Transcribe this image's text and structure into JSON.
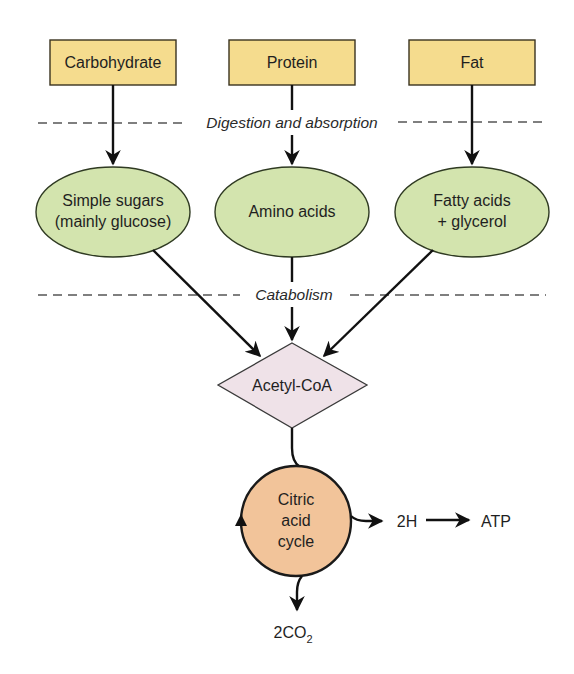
{
  "diagram": {
    "colors": {
      "nutrient_box": "#f5dc8e",
      "product_ellipse": "#d3e4ae",
      "acetyl_diamond": "#efe2e8",
      "cycle_circle": "#f2c49a",
      "arrow": "#111111",
      "dashed_separator": "#555555"
    },
    "nutrients": [
      {
        "label": "Carbohydrate"
      },
      {
        "label": "Protein"
      },
      {
        "label": "Fat"
      }
    ],
    "stages": {
      "digestion": "Digestion and absorption",
      "catabolism": "Catabolism"
    },
    "products": [
      {
        "line1": "Simple sugars",
        "line2": "(mainly glucose)"
      },
      {
        "line1": "Amino acids",
        "line2": ""
      },
      {
        "line1": "Fatty acids",
        "line2": "+ glycerol"
      }
    ],
    "intermediate": {
      "label": "Acetyl-CoA"
    },
    "cycle": {
      "line1": "Citric",
      "line2": "acid",
      "line3": "cycle"
    },
    "outputs": {
      "hydrogen": "2H",
      "energy": "ATP",
      "co2_main": "2CO",
      "co2_subscript": "2"
    }
  }
}
